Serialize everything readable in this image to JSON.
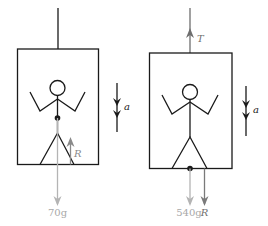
{
  "diagram": {
    "colors": {
      "line": "#1a1a1a",
      "force_dark": "#6e6e6e",
      "force_light": "#b4b4b4",
      "label_light": "#a8a8a8"
    },
    "left_panel": {
      "acceleration_label": "a",
      "normal_force_label": "R",
      "weight_label": "70g"
    },
    "right_panel": {
      "tension_label": "T",
      "acceleration_label": "a",
      "weight_label": "540g",
      "reaction_label": "R"
    }
  }
}
